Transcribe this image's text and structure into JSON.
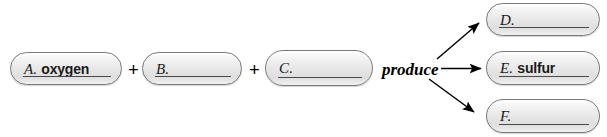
{
  "diagram": {
    "operator_plus": "+",
    "relation_label": "produce",
    "accent_line_color": "#4a4a4a",
    "capsule_border_color": "#7a7a7a",
    "capsule_fill_color": "#e6e6e6"
  },
  "reactants": [
    {
      "letter": "A.",
      "answer": "oxygen",
      "filled": true
    },
    {
      "letter": "B.",
      "answer": "",
      "filled": false
    },
    {
      "letter": "C.",
      "answer": "",
      "filled": false
    }
  ],
  "products": [
    {
      "letter": "D.",
      "answer": "",
      "filled": false
    },
    {
      "letter": "E.",
      "answer": "sulfur",
      "filled": true
    },
    {
      "letter": "F.",
      "answer": "",
      "filled": false
    }
  ],
  "arrows": [
    {
      "name": "arrow-to-d",
      "direction": "up-right"
    },
    {
      "name": "arrow-to-e",
      "direction": "right"
    },
    {
      "name": "arrow-to-f",
      "direction": "down-right"
    }
  ]
}
